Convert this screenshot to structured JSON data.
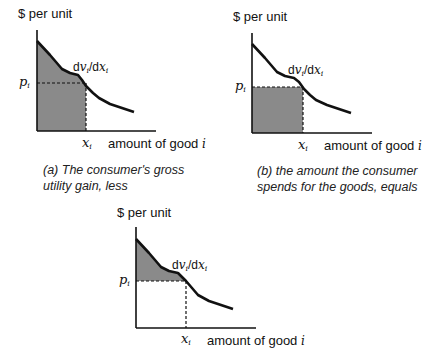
{
  "common": {
    "y_axis_label": "$ per unit",
    "x_axis_label_prefix": "amount of good",
    "x_axis_label_var": "i",
    "curve_label_d1": "dv",
    "curve_label_sub1": "i",
    "curve_label_slash": "/d",
    "curve_label_x": "x",
    "curve_label_sub2": "i",
    "price_label": "p",
    "price_sub": "i",
    "quantity_label": "x",
    "quantity_sub": "i"
  },
  "panels": [
    {
      "id": "a",
      "caption_line1": "(a) The consumer's gross",
      "caption_line2": "utility gain, less",
      "shaded_region": "area under marginal utility curve from 0 to x_i"
    },
    {
      "id": "b",
      "caption_line1": "(b) the amount the consumer",
      "caption_line2": "spends for the goods, equals",
      "shaded_region": "rectangle p_i × x_i"
    },
    {
      "id": "c",
      "caption_line1": "",
      "caption_line2": "",
      "shaded_region": "area between curve and p_i from 0 to x_i (consumer surplus)"
    }
  ],
  "colors": {
    "shade": "#8a8a8a",
    "line": "#111111",
    "background": "#ffffff"
  }
}
